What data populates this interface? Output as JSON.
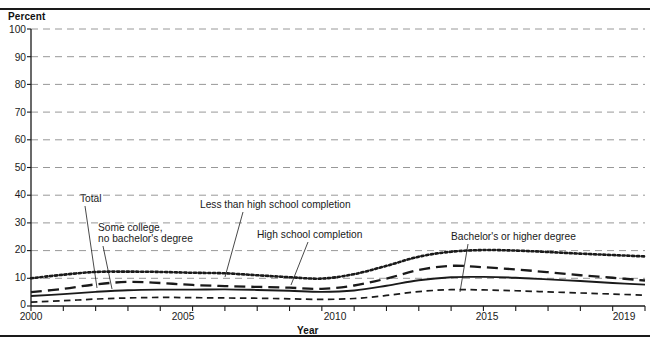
{
  "figure": {
    "y_axis_title": "Percent",
    "x_axis_title": "Year"
  },
  "annotations": {
    "total": "Total",
    "some_college": "Some college,",
    "some_college_line2": "no bachelor's degree",
    "less_than_hs": "Less than high school completion",
    "hs_completion": "High school completion",
    "bachelors": "Bachelor's or higher degree"
  },
  "chart_data": {
    "type": "line",
    "title": "",
    "xlabel": "Year",
    "ylabel": "Percent",
    "xlim": [
      2000,
      2019
    ],
    "ylim": [
      0,
      100
    ],
    "ytick_values": [
      0,
      10,
      20,
      30,
      40,
      50,
      60,
      70,
      80,
      90,
      100
    ],
    "ytick_labels": [
      "0",
      "10",
      "20",
      "30",
      "40",
      "50",
      "60",
      "70",
      "80",
      "90",
      "100"
    ],
    "xtick_values": [
      2000,
      2001,
      2002,
      2003,
      2004,
      2005,
      2006,
      2007,
      2008,
      2009,
      2010,
      2011,
      2012,
      2013,
      2014,
      2015,
      2016,
      2017,
      2018,
      2019
    ],
    "xtick_labeled": [
      2000,
      2005,
      2010,
      2015,
      2019
    ],
    "xtick_labels": [
      "2000",
      "2005",
      "2010",
      "2015",
      "2019"
    ],
    "grid": "horizontal-dashed",
    "legend_position": "inline-annotations",
    "x": [
      2000,
      2001,
      2002,
      2003,
      2004,
      2005,
      2006,
      2007,
      2008,
      2009,
      2010,
      2011,
      2012,
      2013,
      2014,
      2015,
      2016,
      2017,
      2018,
      2019
    ],
    "series": [
      {
        "name": "Less than high school completion",
        "style": "dotted",
        "color": "#1a1a1a",
        "values": [
          10.0,
          11.3,
          12.3,
          12.4,
          12.3,
          12.0,
          11.8,
          11.1,
          10.4,
          9.9,
          11.5,
          14.5,
          17.8,
          19.6,
          20.2,
          20.0,
          19.5,
          18.9,
          18.4,
          17.9
        ]
      },
      {
        "name": "High school completion",
        "style": "long-dash",
        "color": "#1a1a1a",
        "values": [
          5.0,
          6.2,
          7.8,
          8.7,
          8.3,
          7.6,
          7.2,
          6.9,
          6.6,
          6.2,
          7.4,
          9.9,
          13.0,
          14.5,
          14.0,
          13.2,
          12.2,
          11.1,
          10.2,
          9.2
        ]
      },
      {
        "name": "Total",
        "style": "solid",
        "color": "#1a1a1a",
        "values": [
          3.6,
          4.3,
          5.1,
          5.7,
          5.9,
          5.9,
          6.0,
          5.8,
          5.5,
          5.1,
          5.6,
          7.3,
          9.3,
          10.4,
          10.5,
          10.2,
          9.6,
          9.0,
          8.3,
          7.7
        ]
      },
      {
        "name": "Bachelor's or higher degree",
        "style": "short-dash",
        "color": "#1a1a1a",
        "values": [
          1.4,
          1.9,
          2.5,
          2.9,
          3.1,
          3.0,
          2.9,
          2.8,
          2.6,
          2.4,
          2.7,
          3.8,
          5.2,
          5.9,
          5.8,
          5.5,
          5.1,
          4.7,
          4.3,
          3.9
        ]
      }
    ]
  }
}
